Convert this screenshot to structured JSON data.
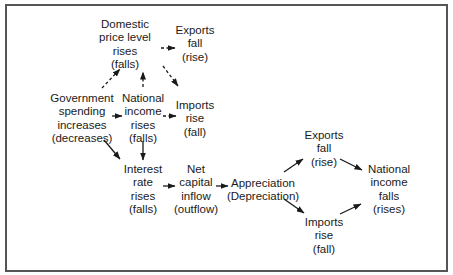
{
  "diagram": {
    "type": "flowchart",
    "nodes": {
      "price_level": {
        "lines": [
          "Domestic",
          "price level",
          "rises",
          "(falls)"
        ]
      },
      "exports_top": {
        "lines": [
          "Exports",
          "fall",
          "(rise)"
        ]
      },
      "government": {
        "lines": [
          "Government",
          "spending",
          "increases",
          "(decreases)"
        ]
      },
      "national_income_mid": {
        "lines": [
          "National",
          "income",
          "rises",
          "(falls)"
        ]
      },
      "imports_mid": {
        "lines": [
          "Imports",
          "rise",
          "(fall)"
        ]
      },
      "interest_rate": {
        "lines": [
          "Interest",
          "rate",
          "rises",
          "(falls)"
        ]
      },
      "net_capital": {
        "lines": [
          "Net",
          "capital",
          "inflow",
          "(outflow)"
        ]
      },
      "appreciation": {
        "lines": [
          "Appreciation",
          "(Depreciation)"
        ]
      },
      "exports_right": {
        "lines": [
          "Exports",
          "fall",
          "(rise)"
        ]
      },
      "national_income_final": {
        "lines": [
          "National",
          "income",
          "falls",
          "(rises)"
        ]
      },
      "imports_right": {
        "lines": [
          "Imports",
          "rise",
          "(fall)"
        ]
      }
    },
    "edges": [
      {
        "from": "government",
        "to": "price_level",
        "style": "dashed"
      },
      {
        "from": "national_income_mid",
        "to": "price_level",
        "style": "dashed"
      },
      {
        "from": "price_level",
        "to": "exports_top",
        "style": "dashed"
      },
      {
        "from": "price_level",
        "to": "imports_mid",
        "style": "dashed"
      },
      {
        "from": "government",
        "to": "national_income_mid",
        "style": "solid"
      },
      {
        "from": "national_income_mid",
        "to": "imports_mid",
        "style": "dashed"
      },
      {
        "from": "government",
        "to": "interest_rate",
        "style": "solid"
      },
      {
        "from": "national_income_mid",
        "to": "interest_rate",
        "style": "solid"
      },
      {
        "from": "interest_rate",
        "to": "net_capital",
        "style": "solid"
      },
      {
        "from": "net_capital",
        "to": "appreciation",
        "style": "solid"
      },
      {
        "from": "appreciation",
        "to": "exports_right",
        "style": "solid"
      },
      {
        "from": "appreciation",
        "to": "imports_right",
        "style": "solid"
      },
      {
        "from": "exports_right",
        "to": "national_income_final",
        "style": "solid"
      },
      {
        "from": "imports_right",
        "to": "national_income_final",
        "style": "solid"
      }
    ],
    "colors": {
      "ink": "#1a1a1a",
      "frame": "#555555",
      "background": "#ffffff"
    }
  }
}
